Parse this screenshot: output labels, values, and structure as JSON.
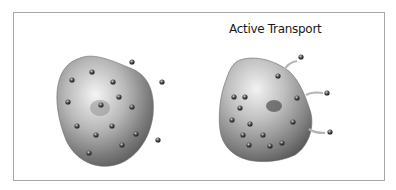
{
  "diagram": {
    "title": "Active Transport",
    "panels": [
      {
        "name": "left-cell",
        "description": "Cell with particles inside and outside"
      },
      {
        "name": "right-cell",
        "description": "Cell with particles being pumped in via arrows"
      }
    ],
    "colors": {
      "frame": "#a8a8a8",
      "cell": "#8a8a8a",
      "particle": "#3a3a3a",
      "arrow": "#b0b0b0"
    }
  }
}
